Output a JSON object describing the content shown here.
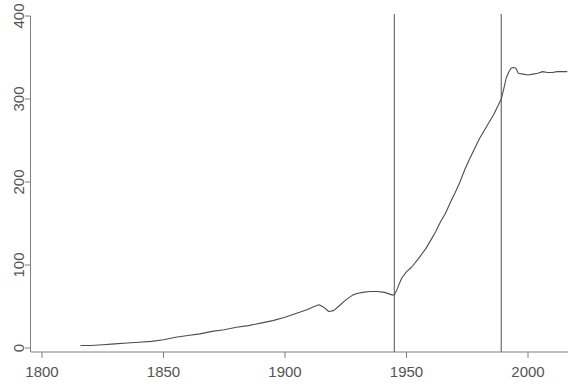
{
  "chart_data": {
    "type": "line",
    "title": "",
    "subtitle": "",
    "xlabel": "",
    "ylabel": "",
    "xlim": [
      1800,
      2020
    ],
    "ylim": [
      0,
      400
    ],
    "grid": false,
    "legend": null,
    "x_ticks": [
      1800,
      1850,
      1900,
      1950,
      2000
    ],
    "x_tick_labels": [
      "1800",
      "1850",
      "1900",
      "1950",
      "2000"
    ],
    "y_ticks": [
      0,
      100,
      200,
      300,
      400
    ],
    "y_tick_labels": [
      "0",
      "100",
      "200",
      "300",
      "400"
    ],
    "line_color": "#4d4d4d",
    "axis_color": "#808080",
    "vline_color": "#6e6e6e",
    "annotations": [
      {
        "type": "vline",
        "x": 1945,
        "label": ""
      },
      {
        "type": "vline",
        "x": 1989,
        "label": ""
      }
    ],
    "series": [
      {
        "name": "value",
        "x": [
          1816,
          1820,
          1825,
          1830,
          1835,
          1840,
          1845,
          1850,
          1855,
          1860,
          1865,
          1870,
          1875,
          1880,
          1885,
          1890,
          1895,
          1900,
          1903,
          1906,
          1909,
          1912,
          1914,
          1916,
          1918,
          1920,
          1922,
          1925,
          1928,
          1930,
          1932,
          1935,
          1938,
          1941,
          1944,
          1945,
          1946,
          1948,
          1950,
          1952,
          1955,
          1958,
          1960,
          1962,
          1964,
          1966,
          1968,
          1970,
          1972,
          1974,
          1976,
          1978,
          1980,
          1982,
          1984,
          1986,
          1988,
          1989,
          1990,
          1991,
          1992,
          1993,
          1994,
          1995,
          1996,
          1998,
          2000,
          2002,
          2004,
          2006,
          2008,
          2010,
          2012,
          2014,
          2016
        ],
        "y": [
          3,
          3,
          4,
          5,
          6,
          7,
          8,
          10,
          13,
          15,
          17,
          20,
          22,
          25,
          27,
          30,
          33,
          37,
          40,
          43,
          46,
          50,
          52,
          49,
          44,
          45,
          50,
          58,
          64,
          66,
          67,
          68,
          68,
          67,
          64,
          64,
          70,
          84,
          92,
          97,
          108,
          120,
          130,
          140,
          152,
          162,
          175,
          187,
          200,
          215,
          228,
          240,
          252,
          262,
          272,
          282,
          294,
          300,
          312,
          325,
          332,
          337,
          338,
          337,
          331,
          330,
          329,
          330,
          331,
          333,
          332,
          332,
          333,
          333,
          333
        ]
      }
    ]
  },
  "axes": {
    "x_axis_name": "year-axis",
    "y_axis_name": "value-axis"
  }
}
